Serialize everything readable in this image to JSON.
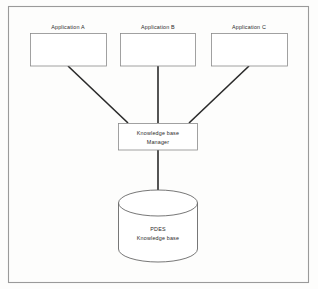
{
  "diagram": {
    "frame": {
      "name": "outer-border"
    },
    "colors": {
      "background": "#fdfdfc",
      "box_stroke": "#8a8a8a",
      "connector_stroke": "#2a2a2a",
      "cylinder_stroke": "#5f5f5f",
      "frame_stroke": "#9a9a9a",
      "text": "#2b2b2b"
    },
    "application_boxes": [
      {
        "id": "application-a",
        "label": "Application A"
      },
      {
        "id": "application-b",
        "label": "Application B"
      },
      {
        "id": "application-c",
        "label": "Application C"
      }
    ],
    "manager_box": {
      "id": "knowledge-base-manager",
      "label_line1": "Knowledge base",
      "label_line2": "Manager"
    },
    "database_cylinder": {
      "id": "pdes-knowledge-base",
      "label_line1": "PDES",
      "label_line2": "Knowledge base"
    },
    "connectors": [
      {
        "id": "connector-a-to-manager",
        "from": "application-a",
        "to": "knowledge-base-manager"
      },
      {
        "id": "connector-b-to-manager",
        "from": "application-b",
        "to": "knowledge-base-manager"
      },
      {
        "id": "connector-c-to-manager",
        "from": "application-c",
        "to": "knowledge-base-manager"
      },
      {
        "id": "connector-manager-to-database",
        "from": "knowledge-base-manager",
        "to": "pdes-knowledge-base"
      }
    ]
  }
}
